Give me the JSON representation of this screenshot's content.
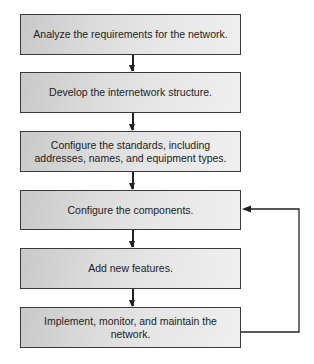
{
  "diagram": {
    "type": "flowchart",
    "steps": [
      {
        "label": "Analyze the requirements for the network."
      },
      {
        "label": "Develop the internetwork structure."
      },
      {
        "label": "Configure the standards, including addresses, names, and equipment types."
      },
      {
        "label": "Configure the components."
      },
      {
        "label": "Add new features."
      },
      {
        "label": "Implement, monitor, and maintain the network."
      }
    ],
    "edges": [
      {
        "from": 0,
        "to": 1
      },
      {
        "from": 1,
        "to": 2
      },
      {
        "from": 2,
        "to": 3
      },
      {
        "from": 3,
        "to": 4
      },
      {
        "from": 4,
        "to": 5
      },
      {
        "from": 5,
        "to": 3,
        "kind": "feedback-loop"
      }
    ],
    "colors": {
      "border": "#3a3a3a",
      "box_fill_dark": "#c9c9c9",
      "box_fill_light": "#efefef",
      "line": "#222222"
    }
  }
}
